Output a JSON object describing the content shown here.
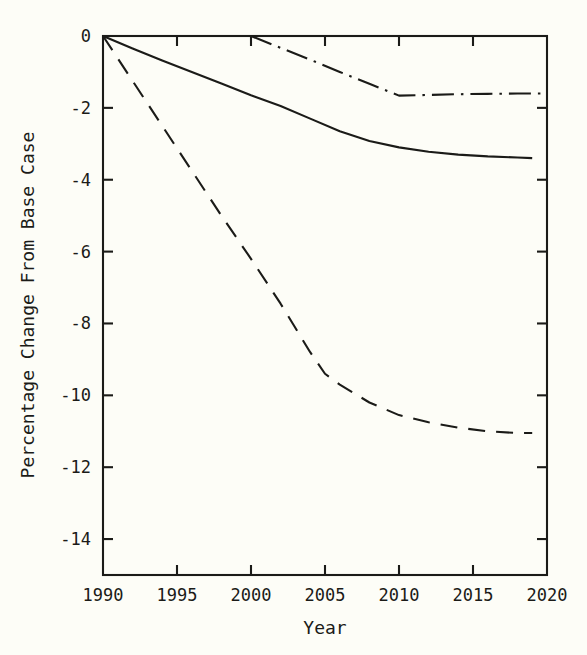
{
  "chart_data": {
    "type": "line",
    "title": "",
    "subtitle": "",
    "xlabel": "Year",
    "ylabel": "Percentage Change From Base Case",
    "xlim": [
      1990,
      2020
    ],
    "ylim": [
      -15,
      0
    ],
    "xticks": [
      1990,
      1995,
      2000,
      2005,
      2010,
      2015,
      2020
    ],
    "xticklabels": [
      "1990",
      "1995",
      "2000",
      "2005",
      "2010",
      "2015",
      "2020"
    ],
    "yticks": [
      0,
      -2,
      -4,
      -6,
      -8,
      -10,
      -12,
      -14
    ],
    "yticklabels": [
      "0",
      "-2",
      "-4",
      "-6",
      "-8",
      "-10",
      "-12",
      "-14"
    ],
    "grid": false,
    "legend": "none",
    "frame": "box",
    "line_color": "#1b1b18",
    "background_color": "#fdfdf7",
    "series": [
      {
        "name": "solid-series",
        "style": "solid",
        "x": [
          1990,
          1992,
          1994,
          1996,
          1998,
          2000,
          2002,
          2004,
          2006,
          2008,
          2010,
          2012,
          2014,
          2016,
          2018,
          2019
        ],
        "values": [
          0,
          -0.35,
          -0.68,
          -1.0,
          -1.32,
          -1.65,
          -1.95,
          -2.3,
          -2.65,
          -2.92,
          -3.1,
          -3.22,
          -3.3,
          -3.35,
          -3.38,
          -3.4
        ]
      },
      {
        "name": "long-dashed-series",
        "style": "dashed",
        "x": [
          1990,
          1992,
          1994,
          1996,
          1998,
          2000,
          2002,
          2004,
          2005,
          2006,
          2008,
          2010,
          2012,
          2014,
          2016,
          2018,
          2019
        ],
        "values": [
          0,
          -1.25,
          -2.5,
          -3.75,
          -5.0,
          -6.2,
          -7.45,
          -8.8,
          -9.4,
          -9.7,
          -10.2,
          -10.55,
          -10.75,
          -10.9,
          -11.0,
          -11.05,
          -11.05
        ]
      },
      {
        "name": "dash-dot-series",
        "style": "dashdot",
        "x": [
          2000,
          2002,
          2004,
          2006,
          2008,
          2010,
          2012,
          2014,
          2016,
          2018,
          2020
        ],
        "values": [
          0,
          -0.33,
          -0.66,
          -1.0,
          -1.33,
          -1.66,
          -1.64,
          -1.62,
          -1.61,
          -1.6,
          -1.6
        ]
      }
    ]
  },
  "axes": {
    "x_title": "Year",
    "y_title": "Percentage Change From Base Case"
  }
}
